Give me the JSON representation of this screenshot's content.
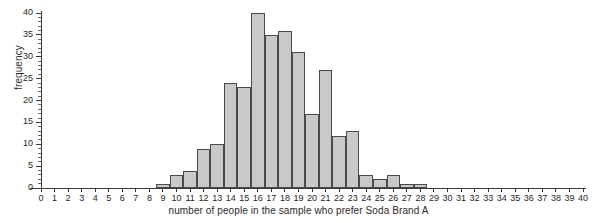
{
  "chart_data": {
    "type": "bar",
    "title": "",
    "subtitle": "",
    "xlabel": "number of people in the sample who prefer Soda Brand A",
    "ylabel": "frequency",
    "categories": [
      0,
      1,
      2,
      3,
      4,
      5,
      6,
      7,
      8,
      9,
      10,
      11,
      12,
      13,
      14,
      15,
      16,
      17,
      18,
      19,
      20,
      21,
      22,
      23,
      24,
      25,
      26,
      27,
      28,
      29,
      30,
      31,
      32,
      33,
      34,
      35,
      36,
      37,
      38,
      39,
      40
    ],
    "values": [
      0,
      0,
      0,
      0,
      0,
      0,
      0,
      0,
      0,
      1,
      3,
      4,
      9,
      10,
      24,
      23,
      40,
      35,
      36,
      31,
      17,
      27,
      12,
      13,
      3,
      2,
      3,
      1,
      1,
      0,
      0,
      0,
      0,
      0,
      0,
      0,
      0,
      0,
      0,
      0,
      0
    ],
    "xlim": [
      0,
      40
    ],
    "ylim": [
      0,
      40
    ],
    "xticks": [
      "0",
      "1",
      "2",
      "3",
      "4",
      "5",
      "6",
      "7",
      "8",
      "9",
      "10",
      "11",
      "12",
      "13",
      "14",
      "15",
      "16",
      "17",
      "18",
      "19",
      "20",
      "21",
      "22",
      "23",
      "24",
      "25",
      "26",
      "27",
      "28",
      "29",
      "30",
      "31",
      "32",
      "33",
      "34",
      "35",
      "36",
      "37",
      "38",
      "39",
      "40"
    ],
    "yticks": [
      "0",
      "5",
      "10",
      "15",
      "20",
      "25",
      "30",
      "35",
      "40"
    ],
    "grid": false,
    "legend": null,
    "bar_fill_color": "#c9c9c9",
    "bar_edge_color": "#4a4a4a",
    "axis_color": "#3a3a3a",
    "background_color": "#ffffff"
  }
}
